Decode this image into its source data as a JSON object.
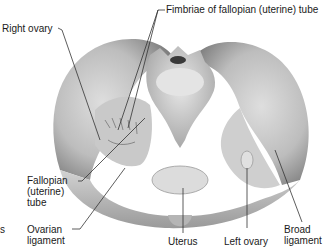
{
  "figure": {
    "style": "grayscale anatomical illustration"
  },
  "labels": {
    "fimbriae": "Fimbriae of fallopian (uterine) tube",
    "right_ovary": "Right ovary",
    "fallopian_tube": "Fallopian\n(uterine)\ntube",
    "ovarian_ligament": "Ovarian\nligament",
    "uterus": "Uterus",
    "left_ovary": "Left ovary",
    "broad_ligament": "Broad\nligament",
    "cropped_left": "s"
  },
  "colors": {
    "bone_light": "#e6e6e6",
    "bone_mid": "#bdbdbd",
    "bone_dark": "#8a8a8a",
    "leader_line": "#333333",
    "text": "#1a1a1a"
  }
}
